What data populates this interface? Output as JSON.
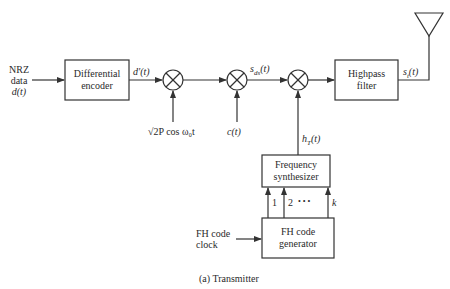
{
  "diagram": {
    "caption": "(a)  Transmitter",
    "input": {
      "line1": "NRZ",
      "line2": "data",
      "line3": "d(t)"
    },
    "blocks": {
      "differential_encoder": {
        "line1": "Differential",
        "line2": "encoder"
      },
      "highpass_filter": {
        "line1": "Highpass",
        "line2": "filter"
      },
      "frequency_synthesizer": {
        "line1": "Frequency",
        "line2": "synthesizer"
      },
      "fh_code_generator": {
        "line1": "FH code",
        "line2": "generator"
      }
    },
    "signals": {
      "encoder_out": "d′(t)",
      "carrier": "√2P cos ω₀t",
      "pn_code": "c(t)",
      "sds": "s",
      "sds_sub": "ds",
      "sds_tail": "(t)",
      "hop": "h",
      "hop_sub": "T",
      "hop_tail": "(t)",
      "tx_out": "s",
      "tx_out_sub": "t",
      "tx_out_tail": "(t)"
    },
    "fh_clock": {
      "line1": "FH code",
      "line2": "clock"
    },
    "bus_labels": {
      "first": "1",
      "second": "2",
      "dots": "•   •   •",
      "last": "k"
    },
    "colors": {
      "stroke": "#333333",
      "text": "#2a2a2a",
      "background": "#ffffff"
    }
  }
}
